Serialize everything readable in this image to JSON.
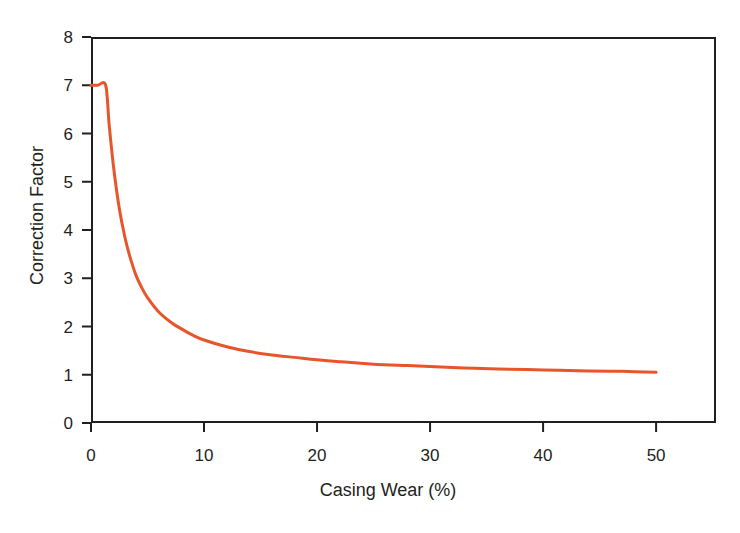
{
  "chart_data": {
    "type": "line",
    "title": "",
    "subtitle": "",
    "xlabel": "Casing Wear (%)",
    "ylabel": "Correction Factor",
    "xlim": [
      0,
      55.3
    ],
    "ylim": [
      0,
      8
    ],
    "xticks": [
      0,
      10,
      20,
      30,
      40,
      50
    ],
    "xtick_labels": [
      "0",
      "10",
      "20",
      "30",
      "40",
      "50"
    ],
    "yticks": [
      0,
      1,
      2,
      3,
      4,
      5,
      6,
      7,
      8
    ],
    "ytick_labels": [
      "0",
      "1",
      "2",
      "3",
      "4",
      "5",
      "6",
      "7",
      "8"
    ],
    "grid": false,
    "legend": false,
    "legend_position": "none",
    "annotations": [],
    "series": [
      {
        "name": "Correction Factor",
        "color": "#e8552b",
        "line_width": 3,
        "x": [
          0,
          0.6,
          1.3,
          1.6,
          2,
          2.5,
          3,
          3.5,
          4,
          4.5,
          5,
          6,
          7,
          8,
          9,
          10,
          12,
          14,
          16,
          18,
          20,
          22,
          25,
          28,
          30,
          33,
          36,
          40,
          44,
          47,
          50
        ],
        "values": [
          7.0,
          7.0,
          7.0,
          6.2,
          5.3,
          4.45,
          3.85,
          3.4,
          3.05,
          2.8,
          2.6,
          2.3,
          2.1,
          1.95,
          1.82,
          1.72,
          1.58,
          1.48,
          1.41,
          1.36,
          1.31,
          1.27,
          1.22,
          1.19,
          1.17,
          1.14,
          1.12,
          1.1,
          1.08,
          1.07,
          1.05
        ]
      }
    ]
  },
  "axes": {
    "x_title": "Casing Wear (%)",
    "y_title": "Correction Factor"
  },
  "style": {
    "curve_color": "#e8552b",
    "axis_color": "#231f20",
    "background": "#ffffff"
  }
}
